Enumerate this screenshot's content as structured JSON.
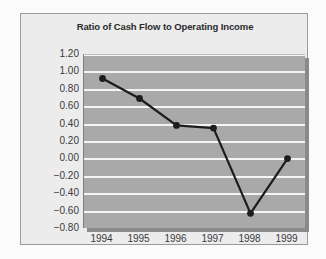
{
  "chart_data": {
    "type": "line",
    "title": "Ratio of Cash Flow to Operating Income",
    "xlabel": "",
    "ylabel": "",
    "categories": [
      "1994",
      "1995",
      "1996",
      "1997",
      "1998",
      "1999"
    ],
    "values": [
      0.93,
      0.7,
      0.39,
      0.36,
      -0.62,
      0.01
    ],
    "series": [
      {
        "name": "Ratio of Cash Flow to Operating Income",
        "values": [
          0.93,
          0.7,
          0.39,
          0.36,
          -0.62,
          0.01
        ]
      }
    ],
    "ylim": [
      -0.8,
      1.2
    ],
    "ytick_step": 0.2,
    "ytick_labels": [
      "1.20",
      "1.00",
      "0.80",
      "0.60",
      "0.40",
      "0.20",
      "0.00",
      "−0.20",
      "−0.40",
      "−0.60",
      "−0.80"
    ],
    "ytick_values": [
      1.2,
      1.0,
      0.8,
      0.6,
      0.4,
      0.2,
      0.0,
      -0.2,
      -0.4,
      -0.6,
      -0.8
    ],
    "grid": true,
    "grid_color": "#f4f4f4",
    "legend": false,
    "legend_position": "none",
    "plot_background": "#a9a9a9",
    "frame_background": "#ececed",
    "line_color": "#1c1c1c",
    "marker_color": "#1c1c1c",
    "marker_shape": "circle",
    "annotations": []
  }
}
